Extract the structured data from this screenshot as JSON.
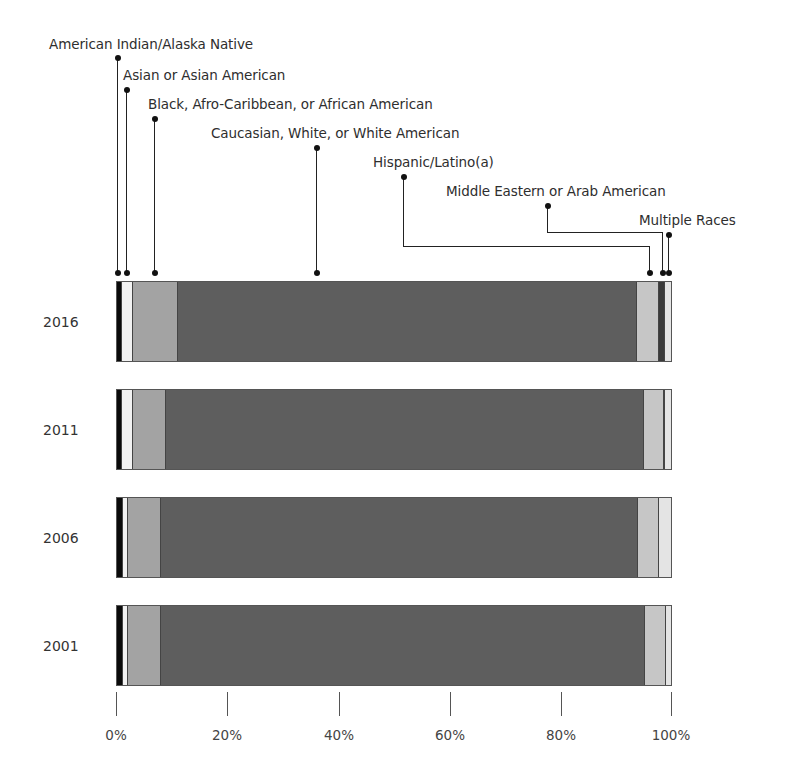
{
  "chart_data": {
    "type": "bar",
    "orientation": "horizontal",
    "stacked": true,
    "normalized": true,
    "title": "",
    "xlabel": "",
    "ylabel": "",
    "xlim": [
      0,
      100
    ],
    "categories": [
      "2016",
      "2011",
      "2006",
      "2001"
    ],
    "series": [
      {
        "name": "American Indian/Alaska Native",
        "color": "#0a0a0a",
        "values": [
          0.9,
          0.9,
          1.1,
          1.1
        ]
      },
      {
        "name": "Asian or Asian American",
        "color": "#f2f2f2",
        "values": [
          2.0,
          2.0,
          0.9,
          0.9
        ]
      },
      {
        "name": "Black, Afro-Caribbean, or African American",
        "color": "#a3a3a3",
        "values": [
          8.1,
          5.9,
          5.9,
          5.9
        ]
      },
      {
        "name": "Caucasian, White, or White American",
        "color": "#5e5e5e",
        "values": [
          82.9,
          86.3,
          86.2,
          87.4
        ]
      },
      {
        "name": "Hispanic/Latino(a)",
        "color": "#c6c6c6",
        "values": [
          4.0,
          3.6,
          3.8,
          3.8
        ]
      },
      {
        "name": "Middle Eastern or Arab American",
        "color": "#3a3a3a",
        "values": [
          1.1,
          0.2,
          0.0,
          0.0
        ]
      },
      {
        "name": "Multiple Races",
        "color": "#e4e4e4",
        "values": [
          1.0,
          1.1,
          2.1,
          0.9
        ]
      }
    ],
    "xticks": [
      "0%",
      "20%",
      "40%",
      "60%",
      "80%",
      "100%"
    ],
    "grid": false,
    "legend_position": "top, callout leader lines"
  },
  "legend": {
    "items": [
      "American Indian/Alaska Native",
      "Asian or Asian American",
      "Black, Afro-Caribbean, or African American",
      "Caucasian, White, or White American",
      "Hispanic/Latino(a)",
      "Middle Eastern or Arab American",
      "Multiple Races"
    ]
  },
  "years": [
    "2016",
    "2011",
    "2006",
    "2001"
  ],
  "axis": {
    "ticks": [
      "0%",
      "20%",
      "40%",
      "60%",
      "80%",
      "100%"
    ]
  }
}
